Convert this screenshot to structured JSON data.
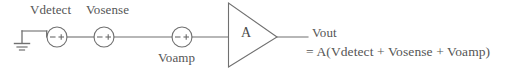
{
  "diagram": {
    "type": "circuit-schematic",
    "stroke_color": "#707070",
    "text_color": "#555555",
    "background": "#ffffff",
    "ground": {
      "label": "ground-symbol",
      "x": 22,
      "y": 40
    },
    "sources": [
      {
        "name": "Vdetect",
        "label": "Vdetect",
        "cx": 57,
        "cy": 37,
        "r": 10,
        "minus": "–",
        "plus": "+",
        "label_position": "above"
      },
      {
        "name": "Vosense",
        "label": "Vosense",
        "cx": 104,
        "cy": 37,
        "r": 10,
        "minus": "–",
        "plus": "+",
        "label_position": "above"
      },
      {
        "name": "Voamp",
        "label": "Voamp",
        "cx": 182,
        "cy": 37,
        "r": 10,
        "minus": "–",
        "plus": "+",
        "label_position": "below"
      }
    ],
    "amplifier": {
      "name": "amplifier",
      "symbol_label": "A",
      "gain": "A",
      "left": 228,
      "right": 277,
      "top": 3,
      "bottom": 67,
      "center_y": 37
    },
    "output": {
      "label": "Vout",
      "equation": "= A(Vdetect + Vosense + Voamp)",
      "wire_from_x": 277,
      "wire_to_x": 308
    }
  }
}
